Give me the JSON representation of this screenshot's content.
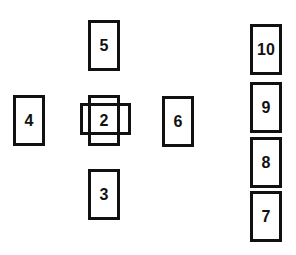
{
  "diagram": {
    "type": "card-spread",
    "cards": [
      {
        "id": "1",
        "label": "",
        "orientation": "horizontal",
        "note": "crossing card under 2"
      },
      {
        "id": "2",
        "label": "2",
        "orientation": "vertical"
      },
      {
        "id": "3",
        "label": "3",
        "orientation": "vertical"
      },
      {
        "id": "4",
        "label": "4",
        "orientation": "vertical"
      },
      {
        "id": "5",
        "label": "5",
        "orientation": "vertical"
      },
      {
        "id": "6",
        "label": "6",
        "orientation": "vertical"
      },
      {
        "id": "7",
        "label": "7",
        "orientation": "vertical"
      },
      {
        "id": "8",
        "label": "8",
        "orientation": "vertical"
      },
      {
        "id": "9",
        "label": "9",
        "orientation": "vertical"
      },
      {
        "id": "10",
        "label": "10",
        "orientation": "vertical"
      }
    ],
    "colors": {
      "border": "#111111",
      "background": "#ffffff",
      "text": "#111111"
    }
  }
}
